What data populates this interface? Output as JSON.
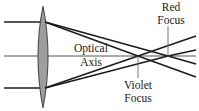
{
  "diagram": {
    "canvas": {
      "width": 199,
      "height": 111,
      "background": "#ffffff"
    },
    "colors": {
      "stroke": "#1a1a1a",
      "lens_fill": "#9e9e9e",
      "lens_stroke": "#4d4d4d",
      "axis": "#555555",
      "leader": "#6b6b6b",
      "text": "#1a1a1a"
    },
    "labels": {
      "optical_axis": {
        "line1": "Optical",
        "line2": "Axis"
      },
      "red_focus": {
        "line1": "Red",
        "line2": "Focus"
      },
      "violet_focus": {
        "line1": "Violet",
        "line2": "Focus"
      }
    },
    "optics": {
      "lens": {
        "center_x": 43,
        "top_y": 6,
        "bottom_y": 108,
        "half_thickness": 10,
        "shape": "biconvex"
      },
      "optical_axis_y": 56,
      "incoming_rays": [
        {
          "name": "upper-parallel-ray",
          "y": 22,
          "from_x": 4,
          "to_x": 43
        },
        {
          "name": "lower-parallel-ray",
          "y": 88,
          "from_x": 4,
          "to_x": 43
        }
      ],
      "violet_focus": {
        "x": 138,
        "y": 56
      },
      "red_focus": {
        "x": 168,
        "y": 56
      },
      "ray_exit_x": 196
    },
    "leaders": [
      {
        "name": "red-focus-leader",
        "x": 168,
        "y1": 26,
        "y2": 56
      },
      {
        "name": "violet-focus-leader",
        "x": 138,
        "y1": 56,
        "y2": 78
      }
    ]
  }
}
